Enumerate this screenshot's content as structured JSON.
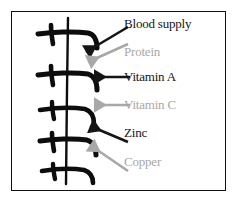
{
  "figure": {
    "background_color": "#ffffff",
    "border_color": "#111111",
    "dark_color": "#151515",
    "gray_color": "#a8a8a8"
  },
  "illustration": {
    "name": "plant-sprig",
    "description": "hand-drawn vertical stem with five pairs of branch strokes"
  },
  "annotations": [
    {
      "label": "Blood supply",
      "color": "#151515",
      "tone": "dark",
      "arrow": "diagonal-down-left-arrow",
      "order": 1
    },
    {
      "label": "Protein",
      "color": "#a8a8a8",
      "tone": "gray",
      "arrow": "diagonal-down-left-arrow",
      "order": 2
    },
    {
      "label": "Vitamin A",
      "color": "#151515",
      "tone": "dark",
      "arrow": "horizontal-left-arrow",
      "order": 3
    },
    {
      "label": "Vitamin C",
      "color": "#a8a8a8",
      "tone": "gray",
      "arrow": "horizontal-left-arrow",
      "order": 4
    },
    {
      "label": "Zinc",
      "color": "#151515",
      "tone": "dark",
      "arrow": "diagonal-up-left-arrow",
      "order": 5
    },
    {
      "label": "Copper",
      "color": "#a8a8a8",
      "tone": "gray",
      "arrow": "diagonal-up-left-arrow",
      "order": 6
    }
  ]
}
